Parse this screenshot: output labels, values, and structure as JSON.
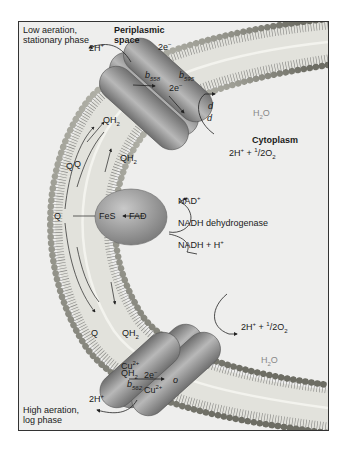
{
  "diagram": {
    "title_regions": {
      "top_left": "Low aeration,",
      "top_left_2": "stationary phase",
      "bottom_left": "High aeration,",
      "bottom_left_2": "log phase"
    },
    "compartments": {
      "periplasm_1": "Periplasmic",
      "periplasm_2": "space",
      "cytoplasm": "Cytoplasm"
    },
    "top_complex": {
      "name": "cytochrome bd oxidase",
      "proton_out": "2H",
      "proton_out_sup": "+",
      "electrons_1": "2e",
      "electrons_1_sup": "−",
      "electrons_2": "2e",
      "electrons_2_sup": "−",
      "b1": "b",
      "b1_sub": "558",
      "b2": "b",
      "b2_sub": "595",
      "d1": "d",
      "d2": "d",
      "product": "H",
      "product_sub": "2",
      "product_tail": "O",
      "substrate": "2H",
      "substrate_sup": "+",
      "substrate_mid": " + ",
      "substrate_half": "1",
      "substrate_half_den": "/2",
      "substrate_o2": "O",
      "substrate_o2_sub": "2"
    },
    "quinone_pool": {
      "labels": [
        "QH2",
        "QH2",
        "Q",
        "Q",
        "Q",
        "QH2",
        "QH2"
      ],
      "q": "Q",
      "qh": "QH",
      "qh_sub": "2"
    },
    "nadh_dehydrogenase": {
      "name": "NADH dehydrogenase",
      "fes": "FeS",
      "fad": "FAD",
      "nad_plus": "NAD",
      "nad_plus_sup": "+",
      "nadh": "NADH + H",
      "nadh_sup": "+"
    },
    "bottom_complex": {
      "name": "cytochrome bo oxidase",
      "cu1": "Cu",
      "cu1_sup": "2+",
      "cu2": "Cu",
      "cu2_sup": "2+",
      "electrons": "2e",
      "electrons_sup": "−",
      "b": "b",
      "b_sub": "562",
      "o": "o",
      "proton_out": "2H",
      "proton_out_sup": "+",
      "substrate": "2H",
      "substrate_sup": "+",
      "substrate_mid": " + ",
      "substrate_half": "1",
      "substrate_half_den": "/2",
      "substrate_o2": "O",
      "substrate_o2_sub": "2",
      "product": "H",
      "product_sub": "2",
      "product_tail": "O"
    },
    "colors": {
      "background": "#eeeeed",
      "protein": "#8c8c8c",
      "protein_light": "#b5b5b5",
      "lipid_head": "#8f8f84",
      "frame": "#333333",
      "grey_text": "#888888"
    }
  }
}
